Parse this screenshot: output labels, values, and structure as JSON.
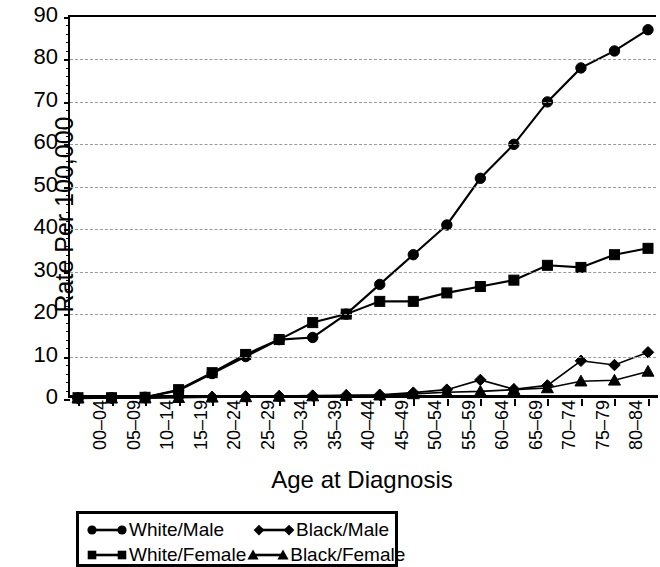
{
  "chart_data": {
    "type": "line",
    "title": "",
    "xlabel": "Age at Diagnosis",
    "ylabel": "Rate Per 100,000",
    "ylim": [
      0,
      90
    ],
    "ytick_labels": [
      "90",
      "80",
      "70",
      "60",
      "50",
      "40",
      "30",
      "20",
      "10",
      "0"
    ],
    "ytick_values": [
      90,
      80,
      70,
      60,
      50,
      40,
      30,
      20,
      10,
      0
    ],
    "grid": true,
    "legend_position": "bottom",
    "categories": [
      "00–04",
      "05–09",
      "10–14",
      "15–19",
      "20–24",
      "25–29",
      "30–34",
      "35–39",
      "40–44",
      "45–49",
      "50–54",
      "55–59",
      "60–64",
      "65–69",
      "70–74",
      "75–79",
      "80–84",
      "85+"
    ],
    "series": [
      {
        "name": "White/Male",
        "marker": "circle",
        "color": "#000000",
        "values": [
          0.2,
          0.3,
          0.4,
          2.0,
          6.0,
          10.0,
          14.0,
          14.5,
          20.0,
          27.0,
          34.0,
          41.0,
          52.0,
          60.0,
          70.0,
          78.0,
          82.0,
          87.0
        ]
      },
      {
        "name": "White/Female",
        "marker": "square",
        "color": "#000000",
        "values": [
          0.3,
          0.3,
          0.4,
          2.2,
          6.2,
          10.5,
          14.0,
          18.0,
          20.0,
          23.0,
          23.0,
          25.0,
          26.5,
          28.0,
          31.5,
          31.0,
          34.0,
          35.5
        ]
      },
      {
        "name": "Black/Male",
        "marker": "diamond",
        "color": "#000000",
        "values": [
          0.2,
          0.2,
          0.3,
          0.4,
          0.5,
          0.6,
          0.7,
          0.8,
          0.9,
          1.0,
          1.5,
          2.2,
          4.5,
          2.3,
          3.2,
          9.0,
          8.0,
          11.0
        ]
      },
      {
        "name": "Black/Female",
        "marker": "triangle",
        "color": "#000000",
        "values": [
          0.2,
          0.2,
          0.2,
          0.3,
          0.4,
          0.5,
          0.6,
          0.7,
          0.8,
          0.9,
          1.2,
          1.6,
          1.8,
          2.2,
          2.6,
          4.2,
          4.4,
          6.5
        ]
      }
    ]
  },
  "legend": {
    "entries": [
      {
        "label": "White/Male",
        "marker": "circle"
      },
      {
        "label": "Black/Male",
        "marker": "diamond"
      },
      {
        "label": "White/Female",
        "marker": "square"
      },
      {
        "label": "Black/Female",
        "marker": "triangle"
      }
    ]
  }
}
